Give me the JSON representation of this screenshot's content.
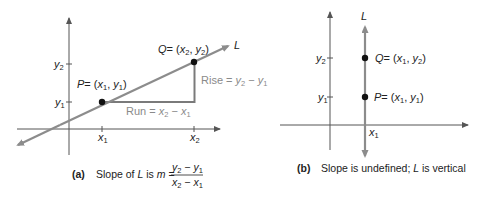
{
  "panel_a": {
    "line_label": "L",
    "point_p": {
      "name": "P",
      "coord_open": "= (",
      "x": "x",
      "xsub": "1",
      "sep": ", ",
      "y": "y",
      "ysub": "1",
      "close": ")"
    },
    "point_q": {
      "name": "Q",
      "coord_open": "= (",
      "x": "x",
      "xsub": "2",
      "sep": ", ",
      "y": "y",
      "ysub": "2",
      "close": ")"
    },
    "run_label": {
      "word": "Run = ",
      "a": "x",
      "asub": "2",
      "minus": " − ",
      "b": "x",
      "bsub": "1"
    },
    "rise_label": {
      "word": "Rise = ",
      "a": "y",
      "asub": "2",
      "minus": " − ",
      "b": "y",
      "bsub": "1"
    },
    "y_ticks": [
      {
        "v": "y",
        "sub": "2"
      },
      {
        "v": "y",
        "sub": "1"
      }
    ],
    "x_ticks": [
      {
        "v": "x",
        "sub": "1"
      },
      {
        "v": "x",
        "sub": "2"
      }
    ],
    "caption": {
      "tag": "(a)",
      "text_pre": "Slope of ",
      "L": "L",
      "text_mid": " is ",
      "m": "m",
      "eq": " =",
      "num": {
        "a": "y",
        "asub": "2",
        "minus": " − ",
        "b": "y",
        "bsub": "1"
      },
      "den": {
        "a": "x",
        "asub": "2",
        "minus": " − ",
        "b": "x",
        "bsub": "1"
      }
    }
  },
  "panel_b": {
    "line_label": "L",
    "point_q": {
      "name": "Q",
      "coord_open": "= (",
      "x": "x",
      "xsub": "1",
      "sep": ", ",
      "y": "y",
      "ysub": "2",
      "close": ")"
    },
    "point_p": {
      "name": "P",
      "coord_open": "= (",
      "x": "x",
      "xsub": "1",
      "sep": ", ",
      "y": "y",
      "ysub": "1",
      "close": ")"
    },
    "y_ticks": [
      {
        "v": "y",
        "sub": "2"
      },
      {
        "v": "y",
        "sub": "1"
      }
    ],
    "x_tick": {
      "v": "x",
      "sub": "1"
    },
    "caption": {
      "tag": "(b)",
      "text_pre": "Slope is undefined; ",
      "L": "L",
      "text_post": " is vertical"
    }
  },
  "colors": {
    "axis": "#555555",
    "line": "#8c8c8c",
    "triangle": "#7a7a7a",
    "point": "#111111",
    "grey_text": "#8a8a8a"
  }
}
